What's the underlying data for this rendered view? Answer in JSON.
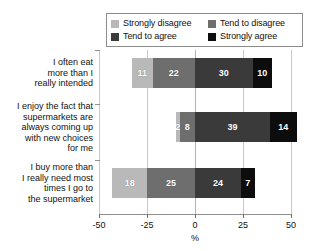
{
  "chart_data": {
    "type": "bar",
    "subtype": "stacked-diverging-horizontal",
    "title": "",
    "xlabel": "%",
    "ylabel": "",
    "xlim": [
      -50,
      50
    ],
    "xticks": [
      -50,
      -25,
      0,
      25,
      50
    ],
    "xtick_labels": [
      "-50",
      "-25",
      "0",
      "25",
      "50"
    ],
    "grid": true,
    "legend_position": "top",
    "categories": [
      "I often eat\nmore than I\nreally intended",
      "I enjoy the fact that\nsupermarkets are\nalways coming up\nwith new choices\nfor me",
      "I buy more than\nI really need most\ntimes I go to\nthe supermarket"
    ],
    "series": [
      {
        "name": "Strongly disagree",
        "color": "#b9b9b9",
        "side": "negative",
        "values": [
          11,
          2,
          18
        ]
      },
      {
        "name": "Tend to disagree",
        "color": "#6e6e6e",
        "side": "negative",
        "values": [
          22,
          8,
          25
        ]
      },
      {
        "name": "Tend to agree",
        "color": "#3a3a3a",
        "side": "positive",
        "values": [
          30,
          39,
          24
        ]
      },
      {
        "name": "Strongly agree",
        "color": "#0d0d0d",
        "side": "positive",
        "values": [
          10,
          14,
          7
        ]
      }
    ],
    "legend_entries": [
      {
        "label": "Strongly disagree",
        "color": "#b9b9b9"
      },
      {
        "label": "Tend to disagree",
        "color": "#6e6e6e"
      },
      {
        "label": "Tend to agree",
        "color": "#3a3a3a"
      },
      {
        "label": "Strongly agree",
        "color": "#0d0d0d"
      }
    ],
    "bar_labels": [
      [
        "11",
        "22",
        "30",
        "10"
      ],
      [
        "2",
        "8",
        "39",
        "14"
      ],
      [
        "18",
        "25",
        "24",
        "7"
      ]
    ]
  },
  "colors": {
    "axis": "#8f8f8f",
    "grid": "#c8c8c8",
    "text": "#111111",
    "background": "#ffffff"
  }
}
